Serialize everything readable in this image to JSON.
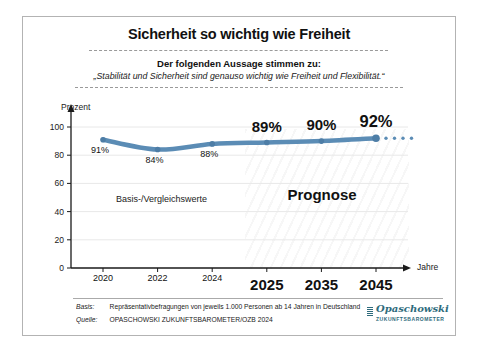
{
  "card": {
    "title": "Sicherheit so wichtig wie Freiheit",
    "subtitle": "Der folgenden Aussage stimmen zu:",
    "quote": "„Stabilität und Sicherheit sind genauso wichtig wie Freiheit und Flexibilität.“"
  },
  "chart_data": {
    "type": "line",
    "title": "Sicherheit so wichtig wie Freiheit",
    "ylabel": "Prozent",
    "xlabel": "Jahre",
    "categories": [
      "2020",
      "2022",
      "2024",
      "2025",
      "2035",
      "2045"
    ],
    "values": [
      91,
      84,
      88,
      89,
      90,
      92
    ],
    "point_labels": [
      "91%",
      "84%",
      "88%",
      "89%",
      "90%",
      "92%"
    ],
    "prognosis_start_index": 3,
    "yticks": [
      0,
      20,
      40,
      60,
      80,
      100
    ],
    "ylim": [
      0,
      100
    ],
    "grid": true,
    "line_color": "#5b8cb5",
    "marker_color": "#4d7da6",
    "forecast_continues_dotted": true,
    "annotations": {
      "baseline_label": "Basis-/Vergleichswerte",
      "forecast_label": "Prognose"
    }
  },
  "footer": {
    "basis_label": "Basis:",
    "basis_text": "Repräsentativbefragungen von jeweils 1.000 Personen ab 14 Jahren in Deutschland",
    "quelle_label": "Quelle:",
    "quelle_text": "OPASCHOWSKI ZUKUNFTSBAROMETER/OZB 2024"
  },
  "logo": {
    "name": "Opaschowski",
    "subname": "ZUKUNFTSBAROMETER",
    "color": "#2e6b7c"
  }
}
